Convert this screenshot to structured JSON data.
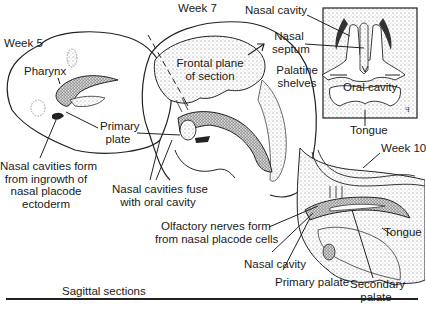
{
  "figure": {
    "caption": "Sagittal sections",
    "panels": {
      "week5": {
        "stage": "Week 5",
        "labels": {
          "pharynx": "Pharynx",
          "primary_plate": [
            "Primary",
            "plate"
          ],
          "nasal_cavities_form": [
            "Nasal cavities form",
            "from ingrowth of",
            "nasal placode",
            "ectoderm"
          ]
        }
      },
      "week7": {
        "stage": "Week 7",
        "labels": {
          "frontal_plane": [
            "Frontal plane",
            "of section"
          ],
          "nasal_cavities_fuse": [
            "Nasal cavities fuse",
            "with oral cavity"
          ]
        }
      },
      "frontal_section": {
        "labels": {
          "nasal_cavity": "Nasal cavity",
          "nasal_septum": [
            "Nasal",
            "septum"
          ],
          "palatine_shelves": [
            "Palatine",
            "shelves"
          ],
          "oral_cavity": "Oral cavity",
          "tongue": "Tongue"
        }
      },
      "week10": {
        "stage": "Week 10",
        "labels": {
          "olfactory_nerves": [
            "Olfactory nerves form",
            "from nasal placode cells"
          ],
          "nasal_cavity": "Nasal cavity",
          "primary_palate": "Primary palate",
          "secondary_palate": [
            "Secondary",
            "palate"
          ],
          "tongue": "Tongue"
        }
      }
    },
    "colors": {
      "ink": "#1a1a1a",
      "stipple": "#9a9a9a",
      "dark_fill": "#3a3a3a",
      "background": "#ffffff"
    }
  }
}
